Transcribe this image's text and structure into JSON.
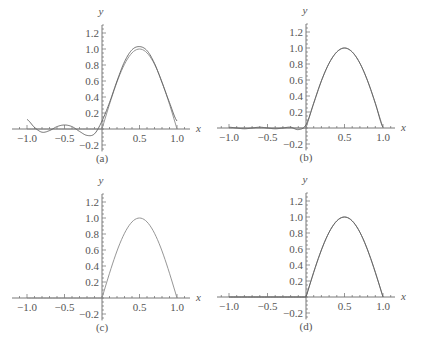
{
  "chart_data": [
    {
      "type": "line",
      "panel": "(a)",
      "xlabel": "x",
      "ylabel": "y",
      "xlim": [
        -1.15,
        1.15
      ],
      "ylim": [
        -0.28,
        1.32
      ],
      "xticks": [
        "-1.0",
        "-0.5",
        "0.5",
        "1.0"
      ],
      "yticks": [
        "-0.2",
        "0.2",
        "0.4",
        "0.6",
        "0.8",
        "1.0",
        "1.2"
      ],
      "series": [
        {
          "name": "f(x)",
          "description": "0 for x<0, sin(pi x) for 0<=x<=1"
        },
        {
          "name": "approximation",
          "x": [
            -1.0,
            -0.9,
            -0.8,
            -0.7,
            -0.6,
            -0.5,
            -0.4,
            -0.3,
            -0.2,
            -0.1,
            0.0,
            0.1,
            0.2,
            0.3,
            0.4,
            0.5,
            0.6,
            0.7,
            0.8,
            0.9,
            1.0
          ],
          "y": [
            0.12,
            0.02,
            -0.04,
            -0.02,
            0.03,
            0.05,
            0.03,
            -0.03,
            -0.08,
            -0.06,
            0.1,
            0.33,
            0.6,
            0.84,
            0.99,
            1.03,
            0.98,
            0.82,
            0.58,
            0.33,
            0.1
          ]
        }
      ]
    },
    {
      "type": "line",
      "panel": "(b)",
      "xlabel": "x",
      "ylabel": "y",
      "xlim": [
        -1.15,
        1.15
      ],
      "ylim": [
        -0.28,
        1.32
      ],
      "xticks": [
        "-1.0",
        "-0.5",
        "0.5",
        "1.0"
      ],
      "yticks": [
        "-0.2",
        "0.2",
        "0.4",
        "0.6",
        "0.8",
        "1.0",
        "1.2"
      ],
      "series": [
        {
          "name": "f(x)",
          "description": "0 for x<0, sin(pi x) for 0<=x<=1"
        },
        {
          "name": "approximation",
          "x": [
            -1.0,
            -0.9,
            -0.8,
            -0.7,
            -0.6,
            -0.5,
            -0.4,
            -0.3,
            -0.2,
            -0.1,
            0.0,
            0.1,
            0.2,
            0.3,
            0.4,
            0.5,
            0.6,
            0.7,
            0.8,
            0.9,
            1.0
          ],
          "y": [
            0.01,
            0.0,
            -0.01,
            0.0,
            0.01,
            0.0,
            -0.01,
            0.0,
            0.01,
            -0.02,
            0.04,
            0.31,
            0.59,
            0.81,
            0.95,
            1.0,
            0.95,
            0.81,
            0.59,
            0.31,
            0.01
          ]
        }
      ]
    },
    {
      "type": "line",
      "panel": "(c)",
      "xlabel": "x",
      "ylabel": "y",
      "xlim": [
        -1.15,
        1.15
      ],
      "ylim": [
        -0.28,
        1.32
      ],
      "xticks": [
        "-1.0",
        "-0.5",
        "0.5",
        "1.0"
      ],
      "yticks": [
        "-0.2",
        "0.2",
        "0.4",
        "0.6",
        "0.8",
        "1.0",
        "1.2"
      ],
      "series": [
        {
          "name": "f(x)",
          "description": "0 for x<0, sin(pi x) for 0<=x<=1"
        }
      ]
    },
    {
      "type": "line",
      "panel": "(d)",
      "xlabel": "x",
      "ylabel": "y",
      "xlim": [
        -1.15,
        1.15
      ],
      "ylim": [
        -0.28,
        1.32
      ],
      "xticks": [
        "-1.0",
        "-0.5",
        "0.5",
        "1.0"
      ],
      "yticks": [
        "-0.2",
        "0.2",
        "0.4",
        "0.6",
        "0.8",
        "1.0",
        "1.2"
      ],
      "series": [
        {
          "name": "f(x)",
          "description": "0 for x<0, sin(pi x) for 0<=x<=1"
        },
        {
          "name": "approximation",
          "description": "visually coincides with f(x)"
        }
      ]
    }
  ],
  "panels": [
    {
      "caption": "(a)",
      "x_label": "x",
      "y_label": "y",
      "ox": 102,
      "oy": 129,
      "sx": 75,
      "sy": 80,
      "x_start": 12,
      "x_end": 190
    },
    {
      "caption": "(b)",
      "x_label": "x",
      "y_label": "y",
      "ox": 306,
      "oy": 128,
      "sx": 77,
      "sy": 80,
      "x_start": 217,
      "x_end": 395
    },
    {
      "caption": "(c)",
      "x_label": "x",
      "y_label": "y",
      "ox": 102,
      "oy": 298,
      "sx": 75,
      "sy": 80,
      "x_start": 12,
      "x_end": 190
    },
    {
      "caption": "(d)",
      "x_label": "x",
      "y_label": "y",
      "ox": 306,
      "oy": 297,
      "sx": 77,
      "sy": 80,
      "x_start": 217,
      "x_end": 395
    }
  ],
  "tick_labels": {
    "x": [
      "−1.0",
      "−0.5",
      "0.5",
      "1.0"
    ],
    "x_values": [
      -1.0,
      -0.5,
      0.5,
      1.0
    ],
    "y": [
      "1.2",
      "1.0",
      "0.8",
      "0.6",
      "0.4",
      "0.2",
      "−0.2"
    ],
    "y_values": [
      1.2,
      1.0,
      0.8,
      0.6,
      0.4,
      0.2,
      -0.2
    ]
  }
}
